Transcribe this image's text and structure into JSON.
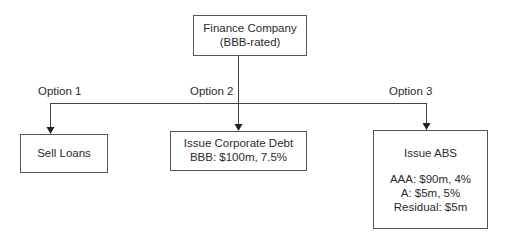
{
  "root": {
    "title": "Finance Company",
    "subtitle": "(BBB-rated)"
  },
  "options": [
    {
      "label": "Option 1",
      "box": {
        "title": "Sell Loans",
        "lines": []
      }
    },
    {
      "label": "Option 2",
      "box": {
        "title": "Issue Corporate Debt",
        "lines": [
          "BBB: $100m, 7.5%"
        ]
      }
    },
    {
      "label": "Option 3",
      "box": {
        "title": "Issue ABS",
        "lines": [
          "AAA: $90m, 4%",
          "A: $5m, 5%",
          "Residual: $5m"
        ]
      }
    }
  ],
  "colors": {
    "line": "#444444",
    "text": "#2b2b2b",
    "border": "#555555"
  }
}
